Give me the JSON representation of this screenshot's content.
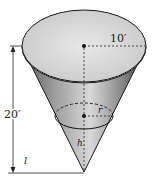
{
  "diagram": {
    "type": "conical-tank",
    "labels": {
      "radius_top": "10′",
      "height_total": "20′",
      "water_radius": "r",
      "water_height": "h",
      "level": "l"
    },
    "colors": {
      "stroke": "#1a1a1a",
      "surface_light": "#e6e6e6",
      "surface_dark": "#4a4a4a"
    }
  }
}
